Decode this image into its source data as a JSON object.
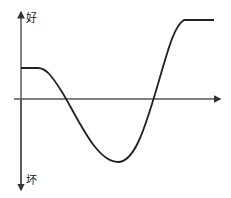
{
  "diagram": {
    "y_axis_top_label": "好",
    "y_axis_bottom_label": "坏",
    "colors": {
      "axis": "#444444",
      "curve": "#222222",
      "background": "#ffffff"
    },
    "curve_description": "flat start above axis, dips below axis to a minimum, rises steeply above axis, flat high plateau",
    "curve_points": [
      [
        21,
        68
      ],
      [
        41,
        68
      ],
      [
        60,
        90
      ],
      [
        118,
        162
      ],
      [
        150,
        120
      ],
      [
        181,
        19
      ],
      [
        214,
        19
      ]
    ]
  }
}
